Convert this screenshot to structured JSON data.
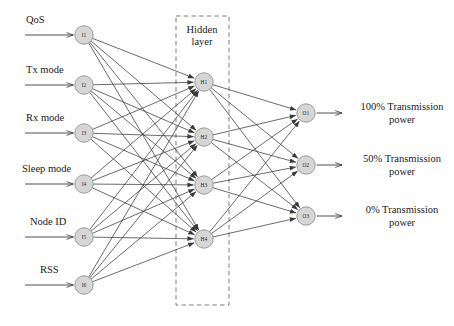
{
  "diagram": {
    "type": "feedforward-neural-network",
    "colors": {
      "node_fill": "#d6d6d6",
      "node_stroke": "#8c8c8c",
      "edge": "#3a3a3a",
      "dashed_box": "#6e6e6e",
      "background": "#ffffff",
      "text": "#1a1a1a"
    },
    "hidden_box": {
      "label_line1": "Hidden",
      "label_line2": "layer",
      "x": 176,
      "y": 16,
      "width": 53,
      "height": 289
    },
    "layers": {
      "input": {
        "name": "input-layer",
        "count": 6,
        "nodes": [
          {
            "id": "I1",
            "label": "I1",
            "cx": 84,
            "cy": 35,
            "signal": "QoS"
          },
          {
            "id": "I2",
            "label": "I2",
            "cx": 84,
            "cy": 85,
            "signal": "Tx mode"
          },
          {
            "id": "I3",
            "label": "I3",
            "cx": 84,
            "cy": 133,
            "signal": "Rx mode"
          },
          {
            "id": "I4",
            "label": "I4",
            "cx": 84,
            "cy": 184,
            "signal": "Sleep mode"
          },
          {
            "id": "I5",
            "label": "I5",
            "cx": 84,
            "cy": 237,
            "signal": "Node ID"
          },
          {
            "id": "I6",
            "label": "I6",
            "cx": 84,
            "cy": 285,
            "signal": "RSS"
          }
        ]
      },
      "hidden": {
        "name": "hidden-layer",
        "count": 4,
        "nodes": [
          {
            "id": "H1",
            "label": "H1",
            "cx": 204,
            "cy": 82
          },
          {
            "id": "H2",
            "label": "H2",
            "cx": 204,
            "cy": 137
          },
          {
            "id": "H3",
            "label": "H3",
            "cx": 204,
            "cy": 185
          },
          {
            "id": "H4",
            "label": "H4",
            "cx": 204,
            "cy": 239
          }
        ]
      },
      "output": {
        "name": "output-layer",
        "count": 3,
        "nodes": [
          {
            "id": "O1",
            "label": "O1",
            "cx": 306,
            "cy": 113,
            "result_line1": "100% Transmission",
            "result_line2": "power"
          },
          {
            "id": "O2",
            "label": "O2",
            "cx": 306,
            "cy": 165,
            "result_line1": "50% Transmission",
            "result_line2": "power"
          },
          {
            "id": "O3",
            "label": "O3",
            "cx": 306,
            "cy": 216,
            "result_line1": "0% Transmission",
            "result_line2": "power"
          }
        ]
      }
    },
    "input_signals": [
      {
        "label": "QoS",
        "text_x": 26,
        "text_y": 14,
        "line_y": 35
      },
      {
        "label": "Tx mode",
        "text_x": 26,
        "text_y": 64,
        "line_y": 85
      },
      {
        "label": "Rx mode",
        "text_x": 26,
        "text_y": 112,
        "line_y": 133
      },
      {
        "label": "Sleep mode",
        "text_x": 22,
        "text_y": 163,
        "line_y": 184
      },
      {
        "label": "Node ID",
        "text_x": 30,
        "text_y": 216,
        "line_y": 237
      },
      {
        "label": "RSS",
        "text_x": 40,
        "text_y": 264,
        "line_y": 285
      }
    ],
    "output_results": [
      {
        "line1": "100% Transmission",
        "line2": "power",
        "text_x": 348,
        "text_y": 101,
        "line_y": 113
      },
      {
        "line1": "50% Transmission",
        "line2": "power",
        "text_x": 348,
        "text_y": 153,
        "line_y": 165
      },
      {
        "line1": "0% Transmission",
        "line2": "power",
        "text_x": 348,
        "text_y": 204,
        "line_y": 216
      }
    ]
  }
}
